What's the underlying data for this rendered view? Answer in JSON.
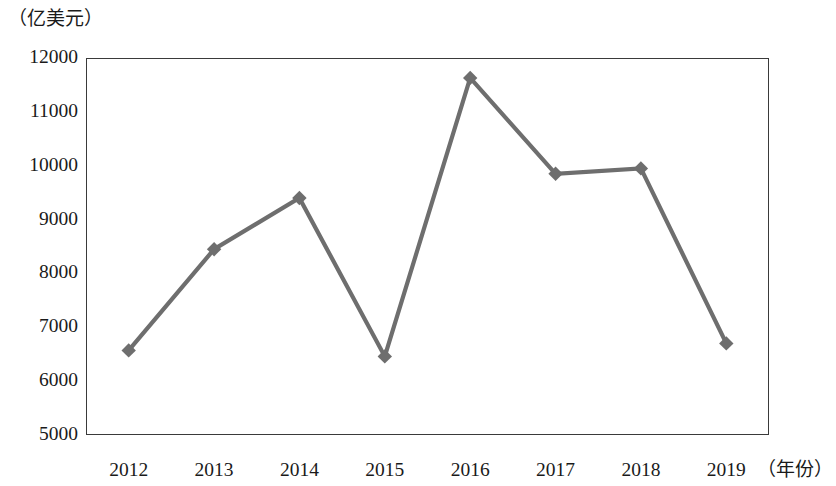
{
  "chart_data": {
    "type": "line",
    "title": "",
    "subtitle": "",
    "unit_label": "（亿美元）",
    "xlabel": "（年份）",
    "ylabel": "",
    "categories": [
      "2012",
      "2013",
      "2014",
      "2015",
      "2016",
      "2017",
      "2018",
      "2019"
    ],
    "x": [
      2012,
      2013,
      2014,
      2015,
      2016,
      2017,
      2018,
      2019
    ],
    "values": [
      6570,
      8450,
      9400,
      6460,
      11630,
      9850,
      9950,
      6700
    ],
    "series": [
      {
        "name": "",
        "values": [
          6570,
          8450,
          9400,
          6460,
          11630,
          9850,
          9950,
          6700
        ]
      }
    ],
    "ylim": [
      5000,
      12000
    ],
    "ytick_values": [
      12000,
      11000,
      10000,
      9000,
      8000,
      7000,
      6000,
      5000
    ],
    "ytick_labels": [
      "12000",
      "11000",
      "10000",
      "9000",
      "8000",
      "7000",
      "6000",
      "5000"
    ],
    "ystep": 1000,
    "grid": true,
    "grid_axis": "y",
    "legend": false,
    "legend_position": "none",
    "marker": "diamond",
    "line_color": "#6e6e6e",
    "marker_color": "#6e6e6e",
    "frame_color": "#3a3a3a",
    "grid_color": "#4a4a4a",
    "background_color": "#ffffff"
  }
}
